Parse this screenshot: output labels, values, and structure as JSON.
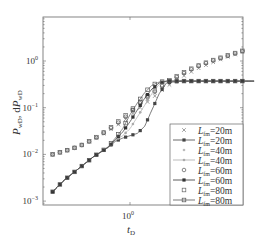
{
  "chart_data": {
    "type": "line",
    "title": "",
    "xlabel": "t_D",
    "ylabel": "P_wD, dP_wD",
    "xscale": "log",
    "yscale": "log",
    "xlim": [
      5e-06,
      1000000000
    ],
    "ylim": [
      0.0008,
      7
    ],
    "xticks": [
      {
        "value": -5,
        "label": "10^-5"
      },
      {
        "value": 0,
        "label": "10^0"
      },
      {
        "value": 5,
        "label": "10^5"
      }
    ],
    "yticks": [
      {
        "value": -3,
        "label": "10^-3"
      },
      {
        "value": -2,
        "label": "10^-2"
      },
      {
        "value": -1,
        "label": "10^-1"
      },
      {
        "value": 0,
        "label": "10^0"
      }
    ],
    "grid": false,
    "legend_position": "lower right",
    "legend": [
      {
        "label": "L_fm=20m",
        "style": "marker",
        "marker": "x",
        "color": "#777777"
      },
      {
        "label": "L_fm=20m",
        "style": "line-marker",
        "marker": "square-filled",
        "color": "#444444"
      },
      {
        "label": "L_fm=40m",
        "style": "marker",
        "marker": "dot",
        "color": "#bbbbbb"
      },
      {
        "label": "L_fm=40m",
        "style": "line-marker",
        "marker": "dot",
        "color": "#aaaaaa"
      },
      {
        "label": "L_fm=60m",
        "style": "marker",
        "marker": "circle",
        "color": "#555555"
      },
      {
        "label": "L_fm=60m",
        "style": "line-marker",
        "marker": "square-filled",
        "color": "#333333"
      },
      {
        "label": "L_fm=80m",
        "style": "marker",
        "marker": "square",
        "color": "#666666"
      },
      {
        "label": "L_fm=80m",
        "style": "line-marker",
        "marker": "square",
        "color": "#555555"
      }
    ],
    "series": [
      {
        "name": "P_wD L_fm=20m",
        "kind": "pressure",
        "marker": "x",
        "color": "#777777",
        "log_t": [
          -5.3,
          -4.5,
          -3.5,
          -2.5,
          -1.5,
          -0.5,
          0.5,
          1.5,
          2.5,
          3.5,
          4.5,
          5.5,
          6.5,
          7.5,
          8.5
        ],
        "log_p": [
          -2.0,
          -1.93,
          -1.83,
          -1.68,
          -1.5,
          -1.3,
          -1.05,
          -0.8,
          -0.55,
          -0.35,
          -0.18,
          -0.05,
          0.07,
          0.17,
          0.27
        ]
      },
      {
        "name": "P_wD L_fm=40m",
        "kind": "pressure",
        "marker": "dot",
        "color": "#bbbbbb",
        "log_t": [
          -5.3,
          -4.5,
          -3.5,
          -2.5,
          -1.5,
          -0.5,
          0.5,
          1.5,
          2.5,
          3.5,
          4.5,
          5.5,
          6.5,
          7.5,
          8.5
        ],
        "log_p": [
          -2.0,
          -1.93,
          -1.83,
          -1.68,
          -1.5,
          -1.28,
          -1.0,
          -0.74,
          -0.5,
          -0.31,
          -0.15,
          -0.03,
          0.08,
          0.18,
          0.27
        ]
      },
      {
        "name": "P_wD L_fm=60m",
        "kind": "pressure",
        "marker": "circle",
        "color": "#555555",
        "log_t": [
          -5.3,
          -4.5,
          -3.5,
          -2.5,
          -1.5,
          -0.5,
          0.5,
          1.5,
          2.5,
          3.5,
          4.5,
          5.5,
          6.5,
          7.5,
          8.5
        ],
        "log_p": [
          -2.0,
          -1.93,
          -1.83,
          -1.68,
          -1.48,
          -1.25,
          -0.96,
          -0.7,
          -0.47,
          -0.29,
          -0.13,
          -0.01,
          0.09,
          0.19,
          0.28
        ]
      },
      {
        "name": "P_wD L_fm=80m",
        "kind": "pressure",
        "marker": "square",
        "color": "#666666",
        "log_t": [
          -5.3,
          -4.5,
          -3.5,
          -2.5,
          -1.5,
          -0.5,
          0.5,
          1.5,
          2.5,
          3.5,
          4.5,
          5.5,
          6.5,
          7.5,
          8.5
        ],
        "log_p": [
          -2.0,
          -1.93,
          -1.83,
          -1.67,
          -1.47,
          -1.22,
          -0.93,
          -0.67,
          -0.45,
          -0.27,
          -0.12,
          0.0,
          0.1,
          0.2,
          0.29
        ]
      },
      {
        "name": "dP_wD L_fm=20m",
        "kind": "derivative",
        "marker": "square-filled",
        "color": "#444444",
        "log_t": [
          -5.3,
          -4.5,
          -3.5,
          -2.5,
          -1.5,
          -1.0,
          -0.5,
          0.0,
          0.5,
          1.0,
          1.5,
          2.0,
          2.5,
          3.5,
          4.5,
          5.5,
          6.5,
          7.5,
          8.5
        ],
        "log_p": [
          -2.8,
          -2.55,
          -2.3,
          -2.05,
          -1.85,
          -1.72,
          -1.65,
          -1.6,
          -1.55,
          -1.4,
          -1.05,
          -0.7,
          -0.47,
          -0.43,
          -0.43,
          -0.43,
          -0.43,
          -0.43,
          -0.43
        ]
      },
      {
        "name": "dP_wD L_fm=40m",
        "kind": "derivative",
        "marker": "dot",
        "color": "#aaaaaa",
        "log_t": [
          -5.3,
          -4.5,
          -3.5,
          -2.5,
          -1.5,
          -1.0,
          -0.5,
          0.0,
          0.5,
          1.0,
          1.5,
          2.0,
          2.5,
          3.5,
          4.5,
          5.5,
          6.5,
          7.5,
          8.5
        ],
        "log_p": [
          -2.8,
          -2.55,
          -2.3,
          -2.05,
          -1.85,
          -1.7,
          -1.6,
          -1.45,
          -1.2,
          -0.95,
          -0.7,
          -0.5,
          -0.44,
          -0.43,
          -0.43,
          -0.43,
          -0.43,
          -0.43,
          -0.43
        ]
      },
      {
        "name": "dP_wD L_fm=60m",
        "kind": "derivative",
        "marker": "square-filled",
        "color": "#333333",
        "log_t": [
          -5.3,
          -4.5,
          -3.5,
          -2.5,
          -1.5,
          -1.0,
          -0.5,
          0.0,
          0.5,
          1.0,
          1.5,
          2.0,
          2.5,
          3.5,
          4.5,
          5.5,
          6.5,
          7.5,
          8.5
        ],
        "log_p": [
          -2.8,
          -2.55,
          -2.3,
          -2.05,
          -1.85,
          -1.68,
          -1.52,
          -1.3,
          -1.05,
          -0.8,
          -0.6,
          -0.47,
          -0.43,
          -0.43,
          -0.43,
          -0.43,
          -0.43,
          -0.43,
          -0.43
        ]
      },
      {
        "name": "dP_wD L_fm=80m",
        "kind": "derivative",
        "marker": "square",
        "color": "#555555",
        "log_t": [
          -5.3,
          -4.5,
          -3.5,
          -2.5,
          -1.5,
          -1.0,
          -0.5,
          0.0,
          0.5,
          1.0,
          1.5,
          2.0,
          2.5,
          3.5,
          4.5,
          5.5,
          6.5,
          7.5,
          8.5
        ],
        "log_p": [
          -2.8,
          -2.55,
          -2.3,
          -2.05,
          -1.84,
          -1.65,
          -1.45,
          -1.15,
          -0.9,
          -0.68,
          -0.52,
          -0.45,
          -0.43,
          -0.43,
          -0.43,
          -0.43,
          -0.43,
          -0.43,
          -0.43
        ]
      }
    ]
  },
  "axes": {
    "x_label_main": "t",
    "x_label_sub": "D",
    "y_label_p": "P",
    "y_label_p_sub": "wD",
    "y_label_sep": ", d",
    "y_label_dp": "P",
    "y_label_dp_sub": "wD"
  },
  "legend_labels": {
    "L": "L",
    "sub": "fm"
  }
}
